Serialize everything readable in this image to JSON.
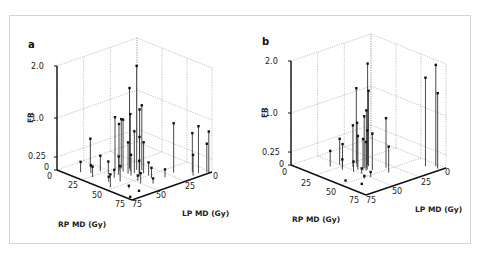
{
  "figure": {
    "panels": [
      {
        "label": "a"
      },
      {
        "label": "b"
      }
    ]
  },
  "chart_data": [
    {
      "type": "scatter3d-stem",
      "panel": "a",
      "title": "",
      "xlabel": "RP MD (Gy)",
      "ylabel": "LP MD (Gy)",
      "zlabel": "FR",
      "x_ticks": [
        "0",
        "25",
        "50",
        "75"
      ],
      "y_ticks": [
        "0",
        "25",
        "50",
        "75"
      ],
      "z_ticks": [
        "0",
        "0.25",
        "1.0",
        "2.0"
      ],
      "xlim": [
        0,
        75
      ],
      "ylim": [
        0,
        75
      ],
      "zlim": [
        0,
        2.0
      ],
      "grid": true,
      "points": [
        {
          "rp": 37,
          "lp": 35,
          "fr": 2.0
        },
        {
          "rp": 32,
          "lp": 37,
          "fr": 1.55
        },
        {
          "rp": 40,
          "lp": 33,
          "fr": 1.25
        },
        {
          "rp": 41,
          "lp": 36,
          "fr": 1.2
        },
        {
          "rp": 36,
          "lp": 40,
          "fr": 1.1
        },
        {
          "rp": 33,
          "lp": 44,
          "fr": 1.0
        },
        {
          "rp": 26,
          "lp": 45,
          "fr": 1.0
        },
        {
          "rp": 28,
          "lp": 41,
          "fr": 0.95
        },
        {
          "rp": 58,
          "lp": 20,
          "fr": 0.95
        },
        {
          "rp": 30,
          "lp": 45,
          "fr": 0.9
        },
        {
          "rp": 40,
          "lp": 40,
          "fr": 0.8
        },
        {
          "rp": 43,
          "lp": 38,
          "fr": 0.7
        },
        {
          "rp": 45,
          "lp": 36,
          "fr": 0.6
        },
        {
          "rp": 38,
          "lp": 44,
          "fr": 0.6
        },
        {
          "rp": 70,
          "lp": 8,
          "fr": 0.9
        },
        {
          "rp": 75,
          "lp": 3,
          "fr": 0.8
        },
        {
          "rp": 66,
          "lp": 10,
          "fr": 0.75
        },
        {
          "rp": 71,
          "lp": 14,
          "fr": 0.4
        },
        {
          "rp": 73,
          "lp": 3,
          "fr": 0.55
        },
        {
          "rp": 12,
          "lp": 55,
          "fr": 0.55
        },
        {
          "rp": 22,
          "lp": 55,
          "fr": 0.3
        },
        {
          "rp": 30,
          "lp": 55,
          "fr": 0.25
        },
        {
          "rp": 35,
          "lp": 50,
          "fr": 0.35
        },
        {
          "rp": 42,
          "lp": 45,
          "fr": 0.4
        },
        {
          "rp": 47,
          "lp": 42,
          "fr": 0.3
        },
        {
          "rp": 50,
          "lp": 36,
          "fr": 0.25
        },
        {
          "rp": 55,
          "lp": 38,
          "fr": 0.2
        },
        {
          "rp": 60,
          "lp": 30,
          "fr": 0.15
        },
        {
          "rp": 14,
          "lp": 66,
          "fr": 0.2
        },
        {
          "rp": 20,
          "lp": 62,
          "fr": 0.15
        },
        {
          "rp": 26,
          "lp": 66,
          "fr": 0.2
        },
        {
          "rp": 37,
          "lp": 56,
          "fr": 0.15
        },
        {
          "rp": 45,
          "lp": 58,
          "fr": 0.3
        },
        {
          "rp": 52,
          "lp": 48,
          "fr": 0.1
        },
        {
          "rp": 57,
          "lp": 50,
          "fr": 0.2
        },
        {
          "rp": 63,
          "lp": 44,
          "fr": 0.1
        },
        {
          "rp": 40,
          "lp": 64,
          "fr": 0.1
        },
        {
          "rp": 58,
          "lp": 62,
          "fr": 0.05
        },
        {
          "rp": 48,
          "lp": 70,
          "fr": 0.25
        },
        {
          "rp": 66,
          "lp": 60,
          "fr": 0.0
        },
        {
          "rp": 70,
          "lp": 72,
          "fr": 0.0
        }
      ]
    },
    {
      "type": "scatter3d-stem",
      "panel": "b",
      "title": "",
      "xlabel": "RP MD (Gy)",
      "ylabel": "LP MD (Gy)",
      "zlabel": "FR",
      "x_ticks": [
        "0",
        "25",
        "50",
        "75"
      ],
      "y_ticks": [
        "0",
        "25",
        "50",
        "75"
      ],
      "z_ticks": [
        "0",
        "0.25",
        "1.0",
        "2.0"
      ],
      "xlim": [
        0,
        75
      ],
      "ylim": [
        0,
        75
      ],
      "zlim": [
        0,
        2.0
      ],
      "grid": true,
      "points": [
        {
          "rp": 35,
          "lp": 36,
          "fr": 1.95
        },
        {
          "rp": 28,
          "lp": 40,
          "fr": 1.45
        },
        {
          "rp": 37,
          "lp": 37,
          "fr": 1.45
        },
        {
          "rp": 38,
          "lp": 40,
          "fr": 1.1
        },
        {
          "rp": 38,
          "lp": 42,
          "fr": 1.0
        },
        {
          "rp": 47,
          "lp": 30,
          "fr": 0.95
        },
        {
          "rp": 33,
          "lp": 44,
          "fr": 0.85
        },
        {
          "rp": 31,
          "lp": 46,
          "fr": 0.8
        },
        {
          "rp": 41,
          "lp": 42,
          "fr": 0.75
        },
        {
          "rp": 44,
          "lp": 40,
          "fr": 0.7
        },
        {
          "rp": 37,
          "lp": 47,
          "fr": 0.65
        },
        {
          "rp": 40,
          "lp": 45,
          "fr": 0.6
        },
        {
          "rp": 42,
          "lp": 44,
          "fr": 0.55
        },
        {
          "rp": 55,
          "lp": 35,
          "fr": 0.5
        },
        {
          "rp": 68,
          "lp": 3,
          "fr": 1.95
        },
        {
          "rp": 63,
          "lp": 8,
          "fr": 1.7
        },
        {
          "rp": 72,
          "lp": 5,
          "fr": 1.45
        },
        {
          "rp": 22,
          "lp": 50,
          "fr": 0.5
        },
        {
          "rp": 27,
          "lp": 52,
          "fr": 0.45
        },
        {
          "rp": 20,
          "lp": 57,
          "fr": 0.3
        },
        {
          "rp": 30,
          "lp": 55,
          "fr": 0.2
        },
        {
          "rp": 38,
          "lp": 52,
          "fr": 0.2
        },
        {
          "rp": 44,
          "lp": 50,
          "fr": 0.1
        },
        {
          "rp": 53,
          "lp": 50,
          "fr": 0.1
        },
        {
          "rp": 52,
          "lp": 55,
          "fr": 0.05
        },
        {
          "rp": 46,
          "lp": 67,
          "fr": 0.0
        },
        {
          "rp": 58,
          "lp": 63,
          "fr": 0.0
        }
      ]
    }
  ],
  "colors": {
    "stem": "#333333",
    "marker": "#111111",
    "grid": "#9a9a9a",
    "axis": "#111111",
    "frame": "#d4d4d4"
  }
}
